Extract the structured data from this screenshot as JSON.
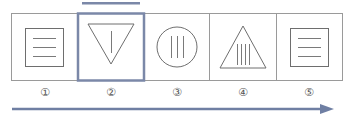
{
  "figure": {
    "panels": [
      {
        "index": 1,
        "label": "①",
        "shape": "square-with-three-horizontal-lines",
        "highlighted": false
      },
      {
        "index": 2,
        "label": "②",
        "shape": "inverted-triangle-with-one-vertical-line",
        "highlighted": true
      },
      {
        "index": 3,
        "label": "③",
        "shape": "circle-with-three-vertical-lines",
        "highlighted": false
      },
      {
        "index": 4,
        "label": "④",
        "shape": "triangle-with-four-vertical-lines",
        "highlighted": false
      },
      {
        "index": 5,
        "label": "⑤",
        "shape": "square-with-three-horizontal-lines",
        "highlighted": false
      }
    ],
    "arrow": {
      "direction": "right"
    },
    "colors": {
      "frame": "#8a8a8a",
      "shape": "#6e6e6e",
      "highlight": "#7b88a8",
      "arrow": "#6f7fa3",
      "label": "#555555"
    }
  }
}
